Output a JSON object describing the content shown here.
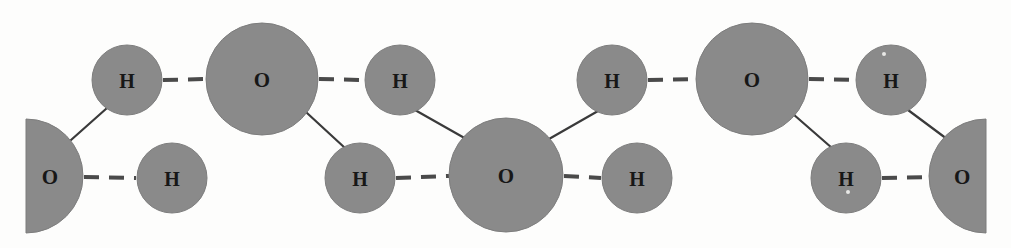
{
  "figure": {
    "type": "molecular-structure-diagram",
    "width": 1011,
    "height": 248,
    "background_color": "#fdfdfc",
    "atom_fill_color": "#8a8a8a",
    "atom_edge_color": "#7d7d7d",
    "label_color": "#171717",
    "covalent_bond_color": "#3a3a3a",
    "hydrogen_bond_color": "#4a4a4a",
    "hydrogen_bond_style": "dashed"
  },
  "atoms": [
    {
      "id": "o-left-edge",
      "label": "O",
      "element": "O",
      "cx": 26,
      "cy": 176,
      "r": 57,
      "shape": "half-circle-right",
      "clipped": "left-edge"
    },
    {
      "id": "h-top-1",
      "label": "H",
      "element": "H",
      "cx": 127,
      "cy": 80,
      "r": 35,
      "shape": "circle",
      "clipped": "none"
    },
    {
      "id": "h-bot-1",
      "label": "H",
      "element": "H",
      "cx": 172,
      "cy": 178,
      "r": 35,
      "shape": "circle",
      "clipped": "none"
    },
    {
      "id": "o-top-1",
      "label": "O",
      "element": "O",
      "cx": 262,
      "cy": 79,
      "r": 56,
      "shape": "circle",
      "clipped": "none"
    },
    {
      "id": "h-top-2",
      "label": "H",
      "element": "H",
      "cx": 400,
      "cy": 80,
      "r": 35,
      "shape": "circle",
      "clipped": "none"
    },
    {
      "id": "h-bot-2",
      "label": "H",
      "element": "H",
      "cx": 360,
      "cy": 178,
      "r": 35,
      "shape": "circle",
      "clipped": "none"
    },
    {
      "id": "o-bot-center",
      "label": "O",
      "element": "O",
      "cx": 506,
      "cy": 175,
      "r": 57,
      "shape": "circle",
      "clipped": "none"
    },
    {
      "id": "h-top-3",
      "label": "H",
      "element": "H",
      "cx": 612,
      "cy": 80,
      "r": 35,
      "shape": "circle",
      "clipped": "none"
    },
    {
      "id": "h-bot-3",
      "label": "H",
      "element": "H",
      "cx": 637,
      "cy": 178,
      "r": 35,
      "shape": "circle",
      "clipped": "none"
    },
    {
      "id": "o-top-2",
      "label": "O",
      "element": "O",
      "cx": 752,
      "cy": 79,
      "r": 56,
      "shape": "circle",
      "clipped": "none"
    },
    {
      "id": "h-top-4",
      "label": "H",
      "element": "H",
      "cx": 891,
      "cy": 80,
      "r": 35,
      "shape": "circle",
      "clipped": "none"
    },
    {
      "id": "h-bot-4",
      "label": "H",
      "element": "H",
      "cx": 846,
      "cy": 178,
      "r": 35,
      "shape": "circle",
      "clipped": "none"
    },
    {
      "id": "o-right-edge",
      "label": "O",
      "element": "O",
      "cx": 986,
      "cy": 176,
      "r": 57,
      "shape": "half-circle-left",
      "clipped": "right-edge"
    }
  ],
  "covalent_bonds": [
    {
      "id": "cb-1",
      "from": "o-left-edge",
      "to": "h-top-1",
      "x1": 71,
      "y1": 140,
      "x2": 107,
      "y2": 108
    },
    {
      "id": "cb-2",
      "from": "o-top-1",
      "to": "h-bot-2",
      "x1": 307,
      "y1": 113,
      "x2": 345,
      "y2": 148
    },
    {
      "id": "cb-3",
      "from": "h-top-2",
      "to": "o-bot-center",
      "x1": 415,
      "y1": 110,
      "x2": 468,
      "y2": 140
    },
    {
      "id": "cb-4",
      "from": "o-bot-center",
      "to": "h-top-3",
      "x1": 549,
      "y1": 139,
      "x2": 598,
      "y2": 111
    },
    {
      "id": "cb-5",
      "from": "o-top-2",
      "to": "h-bot-4",
      "x1": 793,
      "y1": 114,
      "x2": 832,
      "y2": 148
    },
    {
      "id": "cb-6",
      "from": "h-top-4",
      "to": "o-right-edge",
      "x1": 908,
      "y1": 110,
      "x2": 947,
      "y2": 139
    }
  ],
  "hydrogen_bonds": [
    {
      "id": "hb-1",
      "from": "h-top-1",
      "to": "o-top-1",
      "x1": 163,
      "y1": 80,
      "x2": 206,
      "y2": 79
    },
    {
      "id": "hb-2",
      "from": "o-left-edge",
      "to": "h-bot-1",
      "x1": 84,
      "y1": 177,
      "x2": 136,
      "y2": 178
    },
    {
      "id": "hb-3",
      "from": "o-top-1",
      "to": "h-top-2",
      "x1": 319,
      "y1": 79,
      "x2": 364,
      "y2": 80
    },
    {
      "id": "hb-4",
      "from": "h-bot-2",
      "to": "o-bot-center",
      "x1": 396,
      "y1": 178,
      "x2": 449,
      "y2": 176
    },
    {
      "id": "hb-5",
      "from": "o-bot-center",
      "to": "h-bot-3",
      "x1": 564,
      "y1": 176,
      "x2": 601,
      "y2": 178
    },
    {
      "id": "hb-6",
      "from": "h-top-3",
      "to": "o-top-2",
      "x1": 648,
      "y1": 80,
      "x2": 695,
      "y2": 79
    },
    {
      "id": "hb-7",
      "from": "o-top-2",
      "to": "h-top-4",
      "x1": 809,
      "y1": 79,
      "x2": 855,
      "y2": 80
    },
    {
      "id": "hb-8",
      "from": "h-bot-4",
      "to": "o-right-edge",
      "x1": 882,
      "y1": 178,
      "x2": 930,
      "y2": 177
    }
  ],
  "specks": [
    {
      "id": "speck-1",
      "cx": 884,
      "cy": 54,
      "r": 2
    },
    {
      "id": "speck-2",
      "cx": 848,
      "cy": 192,
      "r": 2
    }
  ]
}
